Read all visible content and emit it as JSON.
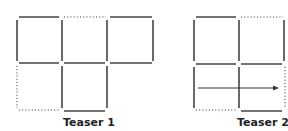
{
  "colors": {
    "stroke": "#444444",
    "dotted": "#777777",
    "background": "#ffffff"
  },
  "figures": [
    {
      "caption": "Teaser 1",
      "description": "Matchstick puzzle: 3 squares on top row, 1 square below middle; dotted segments indicate removed/moved matches"
    },
    {
      "caption": "Teaser 2",
      "description": "2x2 matchstick grid with dotted segments and an arrow pointing right across the bottom row"
    }
  ]
}
